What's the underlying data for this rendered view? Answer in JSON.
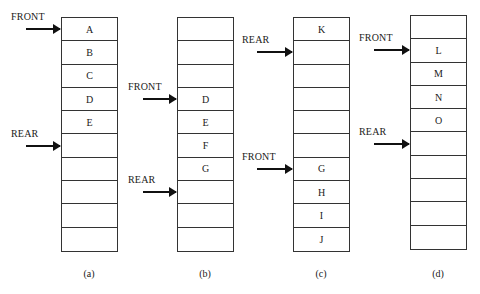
{
  "diagram": {
    "type": "circular-queue-states",
    "queues": [
      {
        "id": "a",
        "caption": "(a)",
        "cells": [
          "A",
          "B",
          "C",
          "D",
          "E",
          "",
          "",
          "",
          "",
          ""
        ],
        "front_label": "FRONT",
        "front_index": 0,
        "rear_label": "REAR",
        "rear_index": 5
      },
      {
        "id": "b",
        "caption": "(b)",
        "cells": [
          "",
          "",
          "",
          "D",
          "E",
          "F",
          "G",
          "",
          "",
          ""
        ],
        "front_label": "FRONT",
        "front_index": 3,
        "rear_label": "REAR",
        "rear_index": 7
      },
      {
        "id": "c",
        "caption": "(c)",
        "cells": [
          "K",
          "",
          "",
          "",
          "",
          "",
          "G",
          "H",
          "I",
          "J"
        ],
        "front_label": "FRONT",
        "front_index": 6,
        "rear_label": "REAR",
        "rear_index": 1
      },
      {
        "id": "d",
        "caption": "(d)",
        "cells": [
          "",
          "L",
          "M",
          "N",
          "O",
          "",
          "",
          "",
          "",
          ""
        ],
        "front_label": "FRONT",
        "front_index": 1,
        "rear_label": "REAR",
        "rear_index": 5
      }
    ]
  }
}
